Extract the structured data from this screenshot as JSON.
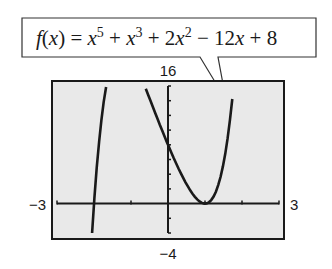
{
  "callout": {
    "fn_name": "f",
    "fn_var": "x",
    "terms": [
      "x^5",
      "x^3",
      "2x^2",
      "12x",
      "8"
    ],
    "text": "f(x) = x^5 + x^3 + 2x^2 − 12x + 8"
  },
  "chart_data": {
    "type": "line",
    "title": "",
    "function": "f(x) = x^5 + x^3 + 2x^2 - 12x + 8",
    "coefficients": {
      "x5": 1,
      "x4": 0,
      "x3": 1,
      "x2": 2,
      "x1": -12,
      "x0": 8
    },
    "xlim": [
      -3,
      3
    ],
    "ylim": [
      -4,
      16
    ],
    "xscl": 1,
    "yscl": 2,
    "window_labels": {
      "xmin": "−3",
      "xmax": "3",
      "ymin": "−4",
      "ymax": "16"
    },
    "background": "#e9e9e9",
    "line_color": "#1a1a1a"
  }
}
